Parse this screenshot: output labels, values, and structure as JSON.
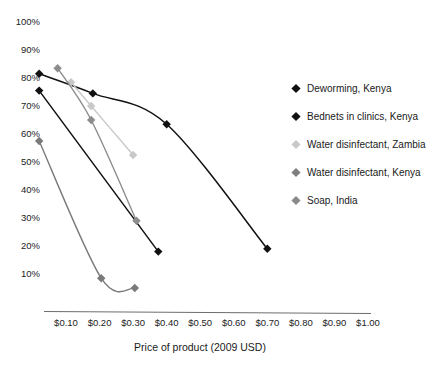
{
  "chart_data": {
    "type": "line",
    "title": "",
    "xlabel": "Price of product (2009 USD)",
    "ylabel": "",
    "xlim": [
      0.0,
      1.05
    ],
    "ylim": [
      0,
      1.0
    ],
    "grid": false,
    "legend_position": "right",
    "xticks": [
      "$0.10",
      "$0.20",
      "$0.30",
      "$0.40",
      "$0.50",
      "$0.60",
      "$0.70",
      "$0.80",
      "$0.90",
      "$1.00"
    ],
    "xtick_values": [
      0.1,
      0.2,
      0.3,
      0.4,
      0.5,
      0.6,
      0.7,
      0.8,
      0.9,
      1.0
    ],
    "yticks": [
      "10%",
      "20%",
      "30%",
      "40%",
      "50%",
      "60%",
      "70%",
      "80%",
      "90%",
      "100%"
    ],
    "ytick_values": [
      0.1,
      0.2,
      0.3,
      0.4,
      0.5,
      0.6,
      0.7,
      0.8,
      0.9,
      1.0
    ],
    "series": [
      {
        "name": "Deworming, Kenya",
        "color": "#111111",
        "marker": "diamond",
        "x": [
          0.02,
          0.18,
          0.4,
          0.7
        ],
        "values": [
          0.815,
          0.745,
          0.635,
          0.19
        ]
      },
      {
        "name": "Bednets in clinics, Kenya",
        "color": "#111111",
        "marker": "diamond",
        "x": [
          0.02,
          0.375
        ],
        "values": [
          0.755,
          0.18
        ]
      },
      {
        "name": "Water disinfectant, Zambia",
        "color": "#c8c8c8",
        "marker": "diamond",
        "x": [
          0.115,
          0.175,
          0.3
        ],
        "values": [
          0.785,
          0.7,
          0.525
        ]
      },
      {
        "name": "Water disinfectant, Kenya",
        "color": "#8c8c8c",
        "marker": "diamond",
        "x": [
          0.075,
          0.175,
          0.31
        ],
        "values": [
          0.835,
          0.65,
          0.29
        ]
      },
      {
        "name": "Soap, India",
        "color": "#7a7a7a",
        "marker": "diamond",
        "x": [
          0.02,
          0.205,
          0.305
        ],
        "values": [
          0.575,
          0.085,
          0.05
        ]
      }
    ]
  },
  "legend": {
    "items": [
      {
        "label": "Deworming, Kenya",
        "color": "#111111"
      },
      {
        "label": "Bednets in clinics, Kenya",
        "color": "#111111"
      },
      {
        "label": "Water disinfectant, Zambia",
        "color": "#c9c9c9"
      },
      {
        "label": "Water disinfectant, Kenya",
        "color": "#7e7e7e"
      },
      {
        "label": "Soap, India",
        "color": "#8a8a8a"
      }
    ]
  },
  "axis": {
    "x_title": "Price of product (2009 USD)"
  }
}
